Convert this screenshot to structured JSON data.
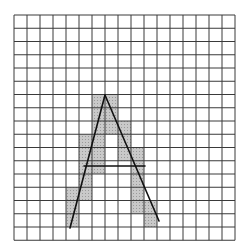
{
  "figure": {
    "grid": {
      "columns": 17,
      "rows": 17,
      "origin_x": 14,
      "origin_y": 15,
      "cell_w": 13,
      "cell_h": 13.25,
      "line_color": "#3a3a3a",
      "background": "#ffffff"
    },
    "shade_color": "#c9c9c9",
    "shaded_cells": [
      [
        6,
        6
      ],
      [
        6,
        7
      ],
      [
        7,
        6
      ],
      [
        7,
        7
      ],
      [
        8,
        6
      ],
      [
        8,
        7
      ],
      [
        8,
        8
      ],
      [
        9,
        5
      ],
      [
        9,
        6
      ],
      [
        9,
        8
      ],
      [
        10,
        5
      ],
      [
        10,
        6
      ],
      [
        10,
        8
      ],
      [
        10,
        9
      ],
      [
        11,
        5
      ],
      [
        11,
        6
      ],
      [
        11,
        9
      ],
      [
        12,
        5
      ],
      [
        12,
        9
      ],
      [
        13,
        4
      ],
      [
        13,
        5
      ],
      [
        13,
        9
      ],
      [
        14,
        4
      ],
      [
        14,
        9
      ],
      [
        14,
        10
      ],
      [
        15,
        4
      ],
      [
        15,
        10
      ]
    ],
    "letter": {
      "character": "A",
      "stroke_color": "#111111",
      "stroke_width": 1.6,
      "apex": [
        105,
        95
      ],
      "left_foot": [
        70,
        228
      ],
      "right_foot": [
        159,
        221
      ],
      "crossbar": [
        [
          84,
          166
        ],
        [
          145,
          166
        ]
      ]
    }
  }
}
